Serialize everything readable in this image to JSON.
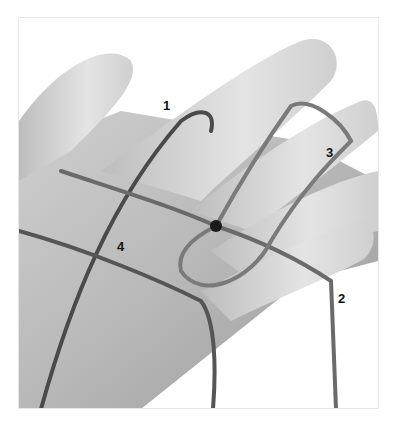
{
  "figure": {
    "labels": [
      {
        "text": "1",
        "x": 163,
        "y": 99
      },
      {
        "text": "3",
        "x": 326,
        "y": 146
      },
      {
        "text": "2",
        "x": 338,
        "y": 292
      },
      {
        "text": "4",
        "x": 117,
        "y": 240
      }
    ]
  }
}
